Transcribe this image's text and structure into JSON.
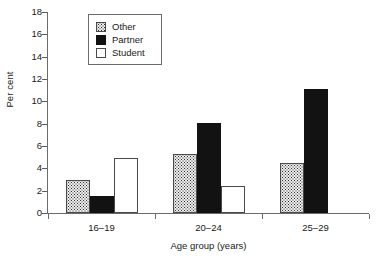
{
  "chart_data": {
    "type": "bar",
    "title": "",
    "xlabel": "Age group (years)",
    "ylabel": "Per cent",
    "categories": [
      "16–19",
      "20–24",
      "25–29"
    ],
    "series": [
      {
        "name": "Other",
        "values": [
          3.0,
          5.3,
          4.5
        ]
      },
      {
        "name": "Partner",
        "values": [
          1.5,
          8.1,
          11.1
        ]
      },
      {
        "name": "Student",
        "values": [
          4.9,
          2.4,
          null
        ]
      }
    ],
    "ylim": [
      0,
      18
    ],
    "yticks": [
      0,
      2,
      4,
      6,
      8,
      10,
      12,
      14,
      16,
      18
    ],
    "ytick_labels": [
      "0",
      "2",
      "4",
      "6",
      "8",
      "10",
      "12",
      "14",
      "16",
      "18"
    ],
    "grid": false,
    "legend_position": "top-left",
    "legend_entries": [
      {
        "label": "Other",
        "swatch": "stippled-gray"
      },
      {
        "label": "Partner",
        "swatch": "solid-black"
      },
      {
        "label": "Student",
        "swatch": "white-outline"
      }
    ]
  }
}
